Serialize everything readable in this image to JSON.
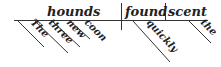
{
  "diagram": {
    "type": "sentence-diagram",
    "sentence": "The three new coon hounds quickly found the scent",
    "subject": "hounds",
    "verb": "found",
    "object": "scent",
    "subject_modifiers": [
      "The",
      "three",
      "new",
      "coon"
    ],
    "verb_modifiers": [
      "quickly"
    ],
    "object_modifiers": [
      "the"
    ]
  }
}
